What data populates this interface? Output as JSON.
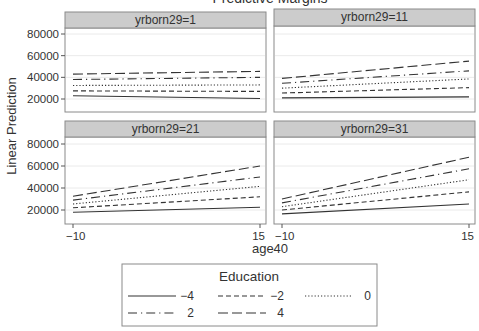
{
  "chart_data": {
    "type": "line",
    "title": "Predictive Margins",
    "xlabel": "age40",
    "ylabel": "Linear Prediction",
    "x": [
      -10,
      15
    ],
    "xticks": [
      -10,
      15
    ],
    "yticks": [
      20000,
      40000,
      60000,
      80000
    ],
    "ylim": [
      10000,
      90000
    ],
    "grid": true,
    "legend": {
      "title": "Education",
      "position": "bottom",
      "entries": [
        {
          "label": "−4",
          "style": "solid"
        },
        {
          "label": "−2",
          "style": "dash"
        },
        {
          "label": "0",
          "style": "dot"
        },
        {
          "label": "2",
          "style": "dashdot"
        },
        {
          "label": "4",
          "style": "longdash"
        }
      ]
    },
    "panels": [
      {
        "label": "yrborn29=1",
        "series": [
          {
            "name": "-4",
            "values": [
              23000,
              20500
            ]
          },
          {
            "name": "-2",
            "values": [
              27500,
              27000
            ]
          },
          {
            "name": "0",
            "values": [
              32500,
              33000
            ]
          },
          {
            "name": "2",
            "values": [
              38000,
              40000
            ]
          },
          {
            "name": "4",
            "values": [
              43000,
              45500
            ]
          }
        ]
      },
      {
        "label": "yrborn29=11",
        "series": [
          {
            "name": "-4",
            "values": [
              21000,
              22000
            ]
          },
          {
            "name": "-2",
            "values": [
              25500,
              30500
            ]
          },
          {
            "name": "0",
            "values": [
              30000,
              38500
            ]
          },
          {
            "name": "2",
            "values": [
              34500,
              46000
            ]
          },
          {
            "name": "4",
            "values": [
              39000,
              55000
            ]
          }
        ]
      },
      {
        "label": "yrborn29=21",
        "series": [
          {
            "name": "-4",
            "values": [
              18000,
              22500
            ]
          },
          {
            "name": "-2",
            "values": [
              22000,
              32000
            ]
          },
          {
            "name": "0",
            "values": [
              25500,
              41500
            ]
          },
          {
            "name": "2",
            "values": [
              29000,
              50000
            ]
          },
          {
            "name": "4",
            "values": [
              32500,
              60000
            ]
          }
        ]
      },
      {
        "label": "yrborn29=31",
        "series": [
          {
            "name": "-4",
            "values": [
              16500,
              25500
            ]
          },
          {
            "name": "-2",
            "values": [
              20000,
              36500
            ]
          },
          {
            "name": "0",
            "values": [
              23000,
              47500
            ]
          },
          {
            "name": "2",
            "values": [
              26500,
              57500
            ]
          },
          {
            "name": "4",
            "values": [
              30000,
              68000
            ]
          }
        ]
      }
    ]
  },
  "axis_labels": {
    "x_ticks": [
      "−10",
      "15"
    ],
    "y_ticks": [
      "20000",
      "40000",
      "60000",
      "80000"
    ]
  },
  "colors": {
    "strip_fill": "#cccccc",
    "panel_border": "#8a8a8a",
    "gridline": "#eaeaea",
    "line": "#333333",
    "text": "#333333"
  }
}
